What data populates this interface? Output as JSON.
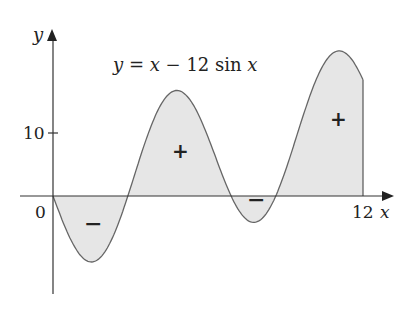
{
  "chart_data": {
    "type": "area",
    "title": "y = x − 12 sin x",
    "function": "x - 12*sin(x)",
    "xlabel": "x",
    "ylabel": "y",
    "xlim": [
      0,
      12
    ],
    "ylim": [
      -10,
      25
    ],
    "x_ticks": [
      {
        "value": 0,
        "label": "0"
      },
      {
        "value": 12,
        "label": "12"
      }
    ],
    "y_ticks": [
      {
        "value": 10,
        "label": "10"
      }
    ],
    "grid": false,
    "shaded_region": {
      "from": 0,
      "to": 12,
      "fill": "#e6e6e6"
    },
    "annotations": [
      {
        "text": "−",
        "x": 1.5,
        "y": -5,
        "meaning": "negative area"
      },
      {
        "text": "+",
        "x": 5.0,
        "y": 7.5,
        "meaning": "positive area"
      },
      {
        "text": "−",
        "x": 8.3,
        "y": -1,
        "meaning": "negative area"
      },
      {
        "text": "+",
        "x": 11.0,
        "y": 12,
        "meaning": "positive area"
      }
    ],
    "sample_points": [
      {
        "x": 0,
        "y": 0
      },
      {
        "x": 1,
        "y": -9.1
      },
      {
        "x": 1.7,
        "y": -10.2
      },
      {
        "x": 2,
        "y": -8.9
      },
      {
        "x": 3,
        "y": 1.3
      },
      {
        "x": 4,
        "y": 13.1
      },
      {
        "x": 4.9,
        "y": 16.9
      },
      {
        "x": 6,
        "y": 9.4
      },
      {
        "x": 7,
        "y": -0.9
      },
      {
        "x": 7.7,
        "y": -4.0
      },
      {
        "x": 8,
        "y": -3.9
      },
      {
        "x": 9,
        "y": 4.1
      },
      {
        "x": 10,
        "y": 16.5
      },
      {
        "x": 11,
        "y": 23.0
      },
      {
        "x": 11.2,
        "y": 23.0
      },
      {
        "x": 12,
        "y": 18.4
      }
    ]
  },
  "labels": {
    "title_lhs": "y",
    "title_eq": " = ",
    "title_x": "x",
    "title_minus": " − 12 sin ",
    "title_x2": "x",
    "y_axis": "y",
    "x_axis": "x",
    "origin": "0",
    "x_tick_12": "12",
    "y_tick_10": "10",
    "sign_neg1": "−",
    "sign_pos1": "+",
    "sign_neg2": "−",
    "sign_pos2": "+"
  }
}
